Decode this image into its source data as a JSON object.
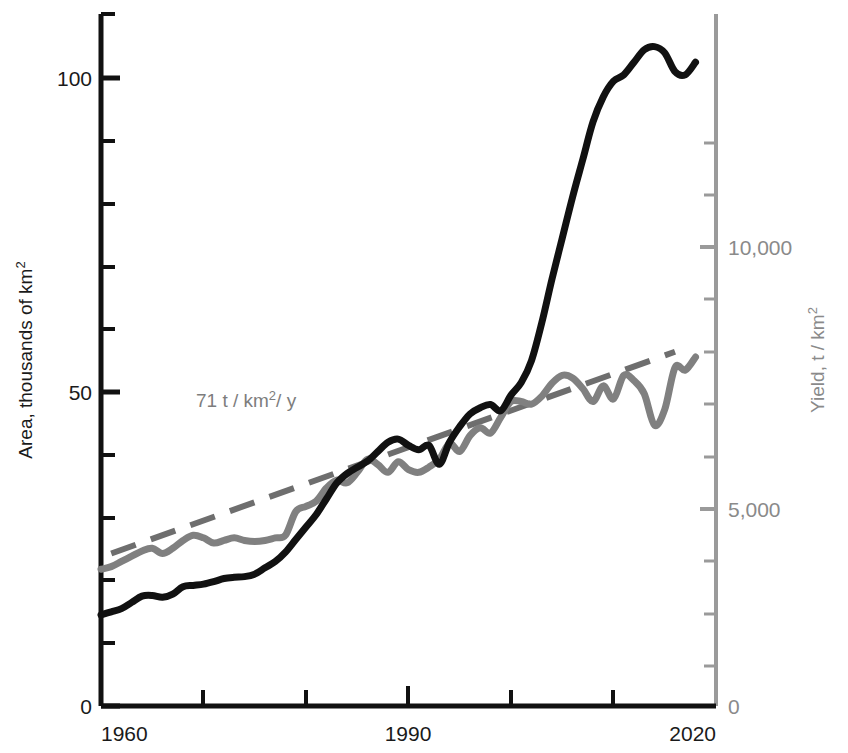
{
  "chart_data": {
    "type": "line",
    "title": "",
    "xlabel": "",
    "xlim": [
      1960,
      2020
    ],
    "x_ticks_labeled": [
      "1960",
      "1990",
      "2020"
    ],
    "x_ticks_labeled_values": [
      1960,
      1990,
      2020
    ],
    "x_minor_ticks": [
      1970,
      1980,
      1990,
      2000,
      2010
    ],
    "grid": false,
    "legend": "none",
    "axes": [
      {
        "id": "left",
        "label": "Area, thousands of km",
        "label_sup": "2",
        "unit": "thousands of km2",
        "color": "#1a1a1a",
        "ylim": [
          0,
          110
        ],
        "ticks_labeled": [
          "0",
          "50",
          "100"
        ],
        "ticks_labeled_values": [
          0,
          50,
          100
        ],
        "minor_tick_step": 10
      },
      {
        "id": "right",
        "label": "Yield, t / km",
        "label_sup": "2",
        "unit": "t/km2",
        "color": "#8a8a8a",
        "ylim": [
          0,
          12500
        ],
        "ticks_labeled": [
          "0",
          "5,000",
          "10,000"
        ],
        "ticks_labeled_values": [
          0,
          5000,
          10000
        ],
        "minor_tick_step": 1000
      }
    ],
    "annotations": [
      {
        "text": "71 t / km",
        "text_sup": "2",
        "text_tail": "/ y",
        "full_text": "71 t/km2/y",
        "color": "#7d7d7d",
        "x": 1974,
        "y_left_axis": 49.5
      }
    ],
    "series": [
      {
        "name": "Area",
        "axis": "left",
        "color": "#111111",
        "style": "solid",
        "width": 6,
        "x": [
          1960,
          1961,
          1962,
          1963,
          1964,
          1965,
          1966,
          1967,
          1968,
          1969,
          1970,
          1971,
          1972,
          1973,
          1974,
          1975,
          1976,
          1977,
          1978,
          1979,
          1980,
          1981,
          1982,
          1983,
          1984,
          1985,
          1986,
          1987,
          1988,
          1989,
          1990,
          1991,
          1992,
          1993,
          1994,
          1995,
          1996,
          1997,
          1998,
          1999,
          2000,
          2001,
          2002,
          2003,
          2004,
          2005,
          2006,
          2007,
          2008,
          2009,
          2010,
          2011,
          2012,
          2013,
          2014,
          2015,
          2016,
          2017,
          2018
        ],
        "values": [
          14.5,
          15.0,
          15.5,
          16.5,
          17.5,
          17.6,
          17.3,
          17.8,
          19.0,
          19.2,
          19.4,
          19.8,
          20.3,
          20.5,
          20.6,
          21.0,
          22.0,
          23.0,
          24.5,
          26.5,
          28.5,
          30.5,
          33.0,
          35.5,
          37.0,
          38.0,
          39.0,
          40.5,
          42.0,
          42.5,
          41.5,
          40.8,
          41.5,
          38.5,
          42.0,
          44.5,
          46.5,
          47.5,
          48.0,
          47.0,
          49.5,
          51.5,
          55.0,
          61.0,
          68.0,
          74.5,
          81.0,
          87.0,
          93.0,
          97.0,
          99.5,
          100.5,
          102.5,
          104.5,
          105.0,
          104.0,
          101.0,
          100.5,
          102.5
        ]
      },
      {
        "name": "Yield",
        "axis": "right",
        "color": "#808080",
        "style": "solid",
        "width": 6,
        "x": [
          1960,
          1961,
          1962,
          1963,
          1964,
          1965,
          1966,
          1967,
          1968,
          1969,
          1970,
          1971,
          1972,
          1973,
          1974,
          1975,
          1976,
          1977,
          1978,
          1979,
          1980,
          1981,
          1982,
          1983,
          1984,
          1985,
          1986,
          1987,
          1988,
          1989,
          1990,
          1991,
          1992,
          1993,
          1994,
          1995,
          1996,
          1997,
          1998,
          1999,
          2000,
          2001,
          2002,
          2003,
          2004,
          2005,
          2006,
          2007,
          2008,
          2009,
          2010,
          2011,
          2012,
          2013,
          2014,
          2015,
          2016,
          2017,
          2018
        ],
        "values": [
          3850,
          3900,
          4000,
          4100,
          4200,
          4250,
          4150,
          4250,
          4400,
          4500,
          4450,
          4350,
          4400,
          4450,
          4400,
          4380,
          4400,
          4450,
          4500,
          4950,
          5050,
          5150,
          5400,
          5550,
          5500,
          5700,
          5950,
          5850,
          5700,
          5900,
          5750,
          5700,
          5800,
          5950,
          6250,
          6100,
          6400,
          6550,
          6450,
          6750,
          7050,
          7050,
          7000,
          7150,
          7400,
          7550,
          7500,
          7300,
          7050,
          7350,
          7100,
          7550,
          7450,
          7200,
          6600,
          6900,
          7700,
          7650,
          7900
        ]
      },
      {
        "name": "Yield trend",
        "axis": "right",
        "color": "#6e6e6e",
        "style": "dashed",
        "width": 6,
        "slope_per_year": 71,
        "x": [
          1961,
          2016
        ],
        "values": [
          4150,
          8000
        ]
      }
    ]
  }
}
